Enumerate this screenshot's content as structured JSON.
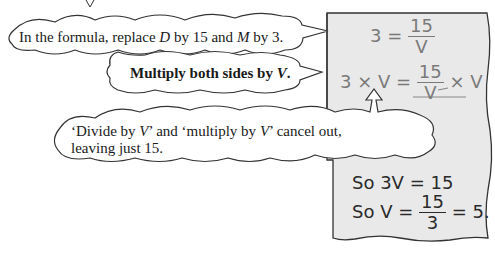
{
  "top_fragment": {
    "glyph": "V"
  },
  "callouts": {
    "c1": {
      "pre": "In the formula, replace ",
      "var1": "D",
      "mid": " by 15 and ",
      "var2": "M",
      "post": " by 3."
    },
    "c2": {
      "pre": "Multiply both sides by ",
      "var": "V",
      "post": "."
    },
    "c3": {
      "line1_a": "‘Divide by ",
      "line1_v1": "V",
      "line1_b": "’ and ‘multiply by ",
      "line1_v2": "V",
      "line1_c": "’ cancel out,",
      "line2": "leaving just 15."
    }
  },
  "working": {
    "panel_color": "#e9e9e9",
    "line1": {
      "lhs": "3 =",
      "num": "15",
      "den": "V"
    },
    "line2": {
      "lhs": "3 × V =",
      "num": "15",
      "den": "V",
      "rhs": "× V"
    },
    "line3": {
      "text": "So 3V = 15"
    },
    "line4": {
      "lhs": "So  V =",
      "num": "15",
      "den": "3",
      "rhs": "= 5."
    }
  }
}
